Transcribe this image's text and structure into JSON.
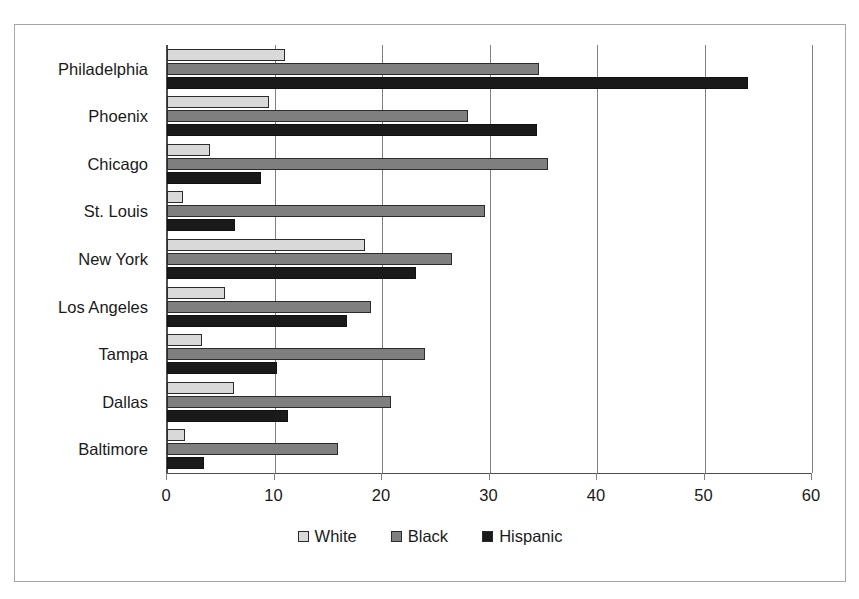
{
  "chart_data": {
    "type": "bar",
    "orientation": "horizontal",
    "title": "",
    "xlabel": "",
    "ylabel": "",
    "xlim": [
      0,
      60
    ],
    "xticks": [
      0,
      10,
      20,
      30,
      40,
      50,
      60
    ],
    "xtick_labels": [
      "0",
      "10",
      "20",
      "30",
      "40",
      "50",
      "60"
    ],
    "grid": true,
    "grid_axis": "x",
    "legend_position": "bottom",
    "categories": [
      "Philadelphia",
      "Phoenix",
      "Chicago",
      "St. Louis",
      "New York",
      "Los Angeles",
      "Tampa",
      "Dallas",
      "Baltimore"
    ],
    "series": [
      {
        "name": "White",
        "color": "#d9d9d9",
        "values": [
          11.0,
          9.5,
          4.0,
          1.5,
          18.4,
          5.4,
          3.3,
          6.2,
          1.7
        ]
      },
      {
        "name": "Black",
        "color": "#7f7f7f",
        "values": [
          34.6,
          28.0,
          35.4,
          29.6,
          26.5,
          19.0,
          24.0,
          20.8,
          15.9
        ]
      },
      {
        "name": "Hispanic",
        "color": "#1a1a1a",
        "values": [
          54.0,
          34.4,
          8.7,
          6.3,
          23.2,
          16.7,
          10.2,
          11.3,
          3.4
        ]
      }
    ]
  },
  "legend": {
    "items": [
      {
        "label": "White",
        "swatch": "white"
      },
      {
        "label": "Black",
        "swatch": "black"
      },
      {
        "label": "Hispanic",
        "swatch": "hispanic"
      }
    ]
  }
}
